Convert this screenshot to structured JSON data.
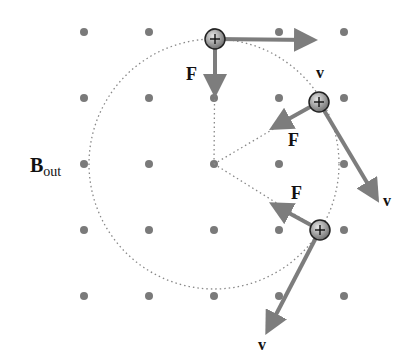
{
  "diagram": {
    "title_label": {
      "main": "B",
      "subscript": "out"
    },
    "field_label": "B out",
    "grid": {
      "xs": [
        84,
        149,
        214,
        279,
        344
      ],
      "ys": [
        32,
        98,
        164,
        230,
        296
      ],
      "dot_color": "#7a7a7a"
    },
    "orbit": {
      "cx": 214,
      "cy": 164,
      "r": 125,
      "color": "#888888"
    },
    "arrow_color": "#7d7d7d",
    "particles": [
      {
        "id": "top",
        "charge": "+",
        "x": 215,
        "y": 39,
        "v": {
          "label": "v",
          "x2": 310,
          "y2": 40,
          "lx": 316,
          "ly": 78
        },
        "F": {
          "label": "F",
          "x2": 215,
          "y2": 90,
          "lx": 186,
          "ly": 80
        }
      },
      {
        "id": "upper-right",
        "charge": "+",
        "x": 319,
        "y": 102,
        "v": {
          "label": "v",
          "x2": 375,
          "y2": 196,
          "lx": 383,
          "ly": 206
        },
        "F": {
          "label": "F",
          "x2": 276,
          "y2": 126,
          "lx": 288,
          "ly": 146
        }
      },
      {
        "id": "lower-right",
        "charge": "+",
        "x": 320,
        "y": 230,
        "v": {
          "label": "v",
          "x2": 269,
          "y2": 328,
          "lx": 258,
          "ly": 350
        },
        "F": {
          "label": "F",
          "x2": 276,
          "y2": 206,
          "lx": 291,
          "ly": 199
        }
      }
    ]
  }
}
